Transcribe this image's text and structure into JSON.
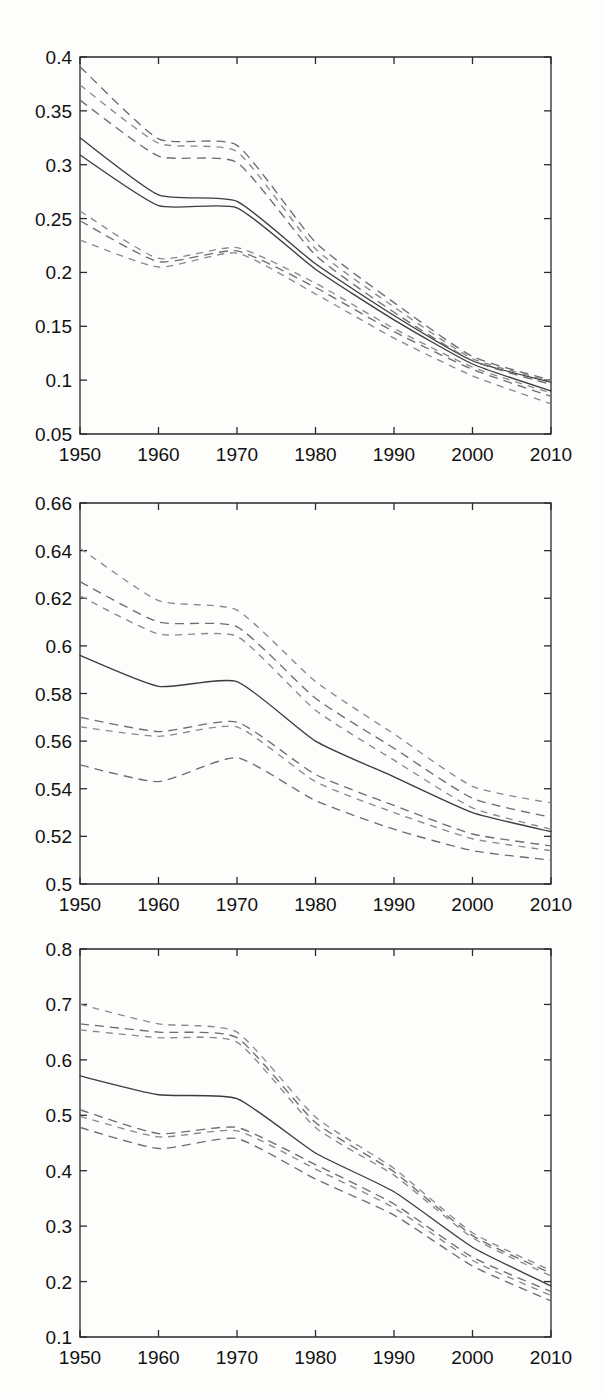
{
  "page": {
    "background": "#fdfdfc",
    "width": 604,
    "height": 1398,
    "panel_count": 3
  },
  "bleed_text": {
    "note": "faint reverse-side print showing through scanned page, illegible",
    "fragments": [
      "",
      "",
      "",
      "",
      "",
      ""
    ]
  },
  "chart_data": [
    {
      "id": "panel-1",
      "type": "line",
      "title": "",
      "xlabel": "",
      "ylabel": "",
      "x": [
        1950,
        1960,
        1970,
        1980,
        1990,
        2000,
        2010
      ],
      "xlim": [
        1950,
        2010
      ],
      "ylim": [
        0.05,
        0.4
      ],
      "xticks": [
        1950,
        1960,
        1970,
        1980,
        1990,
        2000,
        2010
      ],
      "yticks": [
        0.05,
        0.1,
        0.15,
        0.2,
        0.25,
        0.3,
        0.35,
        0.4
      ],
      "xticklabels": [
        "1950",
        "1960",
        "1970",
        "1980",
        "1990",
        "2000",
        "2010"
      ],
      "yticklabels": [
        "0.05",
        "0.1",
        "0.15",
        "0.2",
        "0.25",
        "0.3",
        "0.35",
        "0.4"
      ],
      "grid": false,
      "legend": "none",
      "series": [
        {
          "name": "estimate-a",
          "style": "solid",
          "values": [
            0.325,
            0.272,
            0.266,
            0.208,
            0.16,
            0.118,
            0.098
          ]
        },
        {
          "name": "estimate-b",
          "style": "solid",
          "values": [
            0.309,
            0.262,
            0.26,
            0.203,
            0.156,
            0.115,
            0.09
          ]
        },
        {
          "name": "upper-a",
          "style": "dashed",
          "values": [
            0.391,
            0.324,
            0.318,
            0.228,
            0.172,
            0.122,
            0.1
          ]
        },
        {
          "name": "upper-b",
          "style": "dashed",
          "values": [
            0.374,
            0.32,
            0.312,
            0.222,
            0.168,
            0.12,
            0.099
          ]
        },
        {
          "name": "upper-c",
          "style": "dashed",
          "values": [
            0.36,
            0.308,
            0.302,
            0.216,
            0.163,
            0.118,
            0.096
          ]
        },
        {
          "name": "lower-a",
          "style": "dashed",
          "values": [
            0.257,
            0.213,
            0.223,
            0.19,
            0.148,
            0.112,
            0.088
          ]
        },
        {
          "name": "lower-b",
          "style": "dashed",
          "values": [
            0.248,
            0.21,
            0.22,
            0.186,
            0.145,
            0.11,
            0.085
          ]
        },
        {
          "name": "lower-c",
          "style": "dashed",
          "values": [
            0.23,
            0.205,
            0.218,
            0.18,
            0.139,
            0.104,
            0.078
          ]
        }
      ]
    },
    {
      "id": "panel-2",
      "type": "line",
      "title": "",
      "xlabel": "",
      "ylabel": "",
      "x": [
        1950,
        1960,
        1970,
        1980,
        1990,
        2000,
        2010
      ],
      "xlim": [
        1950,
        2010
      ],
      "ylim": [
        0.5,
        0.66
      ],
      "xticks": [
        1950,
        1960,
        1970,
        1980,
        1990,
        2000,
        2010
      ],
      "yticks": [
        0.5,
        0.52,
        0.54,
        0.56,
        0.58,
        0.6,
        0.62,
        0.64,
        0.66
      ],
      "xticklabels": [
        "1950",
        "1960",
        "1970",
        "1980",
        "1990",
        "2000",
        "2010"
      ],
      "yticklabels": [
        "0.5",
        "0.52",
        "0.54",
        "0.56",
        "0.58",
        "0.6",
        "0.62",
        "0.64",
        "0.66"
      ],
      "grid": false,
      "legend": "none",
      "series": [
        {
          "name": "estimate",
          "style": "solid",
          "values": [
            0.596,
            0.583,
            0.585,
            0.56,
            0.545,
            0.53,
            0.522
          ]
        },
        {
          "name": "upper-a",
          "style": "dashed",
          "values": [
            0.641,
            0.619,
            0.615,
            0.585,
            0.563,
            0.541,
            0.534
          ]
        },
        {
          "name": "upper-b",
          "style": "dashed",
          "values": [
            0.627,
            0.61,
            0.608,
            0.578,
            0.557,
            0.536,
            0.528
          ]
        },
        {
          "name": "upper-c",
          "style": "dashed",
          "values": [
            0.621,
            0.605,
            0.604,
            0.573,
            0.552,
            0.532,
            0.523
          ]
        },
        {
          "name": "lower-a",
          "style": "dashed",
          "values": [
            0.57,
            0.564,
            0.568,
            0.546,
            0.533,
            0.521,
            0.516
          ]
        },
        {
          "name": "lower-b",
          "style": "dashed",
          "values": [
            0.566,
            0.562,
            0.566,
            0.543,
            0.53,
            0.519,
            0.514
          ]
        },
        {
          "name": "lower-c",
          "style": "dashed",
          "values": [
            0.55,
            0.543,
            0.553,
            0.535,
            0.523,
            0.514,
            0.51
          ]
        }
      ]
    },
    {
      "id": "panel-3",
      "type": "line",
      "title": "",
      "xlabel": "",
      "ylabel": "",
      "x": [
        1950,
        1960,
        1970,
        1980,
        1990,
        2000,
        2010
      ],
      "xlim": [
        1950,
        2010
      ],
      "ylim": [
        0.1,
        0.8
      ],
      "xticks": [
        1950,
        1960,
        1970,
        1980,
        1990,
        2000,
        2010
      ],
      "yticks": [
        0.1,
        0.2,
        0.3,
        0.4,
        0.5,
        0.6,
        0.7,
        0.8
      ],
      "xticklabels": [
        "1950",
        "1960",
        "1970",
        "1980",
        "1990",
        "2000",
        "2010"
      ],
      "yticklabels": [
        "0.1",
        "0.2",
        "0.3",
        "0.4",
        "0.5",
        "0.6",
        "0.7",
        "0.8"
      ],
      "grid": false,
      "legend": "none",
      "series": [
        {
          "name": "estimate",
          "style": "solid",
          "values": [
            0.571,
            0.537,
            0.53,
            0.432,
            0.362,
            0.262,
            0.192
          ]
        },
        {
          "name": "upper-a",
          "style": "dashed",
          "values": [
            0.7,
            0.665,
            0.65,
            0.497,
            0.404,
            0.288,
            0.22
          ]
        },
        {
          "name": "upper-b",
          "style": "dashed",
          "values": [
            0.665,
            0.65,
            0.64,
            0.487,
            0.398,
            0.283,
            0.215
          ]
        },
        {
          "name": "upper-c",
          "style": "dashed",
          "values": [
            0.654,
            0.64,
            0.632,
            0.478,
            0.392,
            0.279,
            0.21
          ]
        },
        {
          "name": "lower-a",
          "style": "dashed",
          "values": [
            0.51,
            0.467,
            0.478,
            0.411,
            0.34,
            0.244,
            0.182
          ]
        },
        {
          "name": "lower-b",
          "style": "dashed",
          "values": [
            0.498,
            0.461,
            0.472,
            0.403,
            0.333,
            0.238,
            0.175
          ]
        },
        {
          "name": "lower-c",
          "style": "dashed",
          "values": [
            0.478,
            0.44,
            0.458,
            0.385,
            0.32,
            0.228,
            0.165
          ]
        }
      ]
    }
  ]
}
